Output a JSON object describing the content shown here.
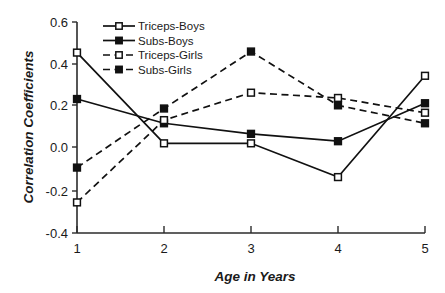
{
  "chart_data": {
    "type": "line",
    "title": "",
    "xlabel": "Age in Years",
    "ylabel": "Correlation Coefficients",
    "x": [
      1,
      2,
      3,
      4,
      5
    ],
    "xticklabels": [
      "1",
      "2",
      "3",
      "4",
      "5"
    ],
    "yticklabels": [
      "-0.4",
      "-0.2",
      "0.0",
      "0.2",
      "0.4",
      "0.6"
    ],
    "yticks": [
      -0.4,
      -0.2,
      0.0,
      0.2,
      0.4,
      0.6
    ],
    "xlim": [
      1,
      5
    ],
    "ylim": [
      -0.4,
      0.6
    ],
    "grid": false,
    "legend_position": "top-center-left",
    "series": [
      {
        "name": "Triceps-Boys",
        "values": [
          0.455,
          0.025,
          0.025,
          -0.135,
          0.345
        ],
        "line_style": "solid",
        "marker": "open-square"
      },
      {
        "name": "Subs-Boys",
        "values": [
          0.235,
          0.12,
          0.07,
          0.035,
          0.215
        ],
        "line_style": "solid",
        "marker": "filled-square"
      },
      {
        "name": "Triceps-Girls",
        "values": [
          -0.255,
          0.135,
          0.265,
          0.24,
          0.17
        ],
        "line_style": "dashed",
        "marker": "open-square"
      },
      {
        "name": "Subs-Girls",
        "values": [
          -0.09,
          0.19,
          0.46,
          0.205,
          0.12
        ],
        "line_style": "dashed",
        "marker": "filled-square"
      }
    ],
    "colors": {
      "line": "#111111",
      "axis": "#2b2b2b",
      "background": "#ffffff",
      "marker_fill_open": "#ffffff",
      "marker_fill_closed": "#111111"
    }
  }
}
